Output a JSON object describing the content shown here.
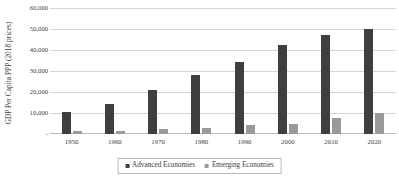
{
  "chart_data": {
    "type": "bar",
    "title": "",
    "subtitle": "",
    "xlabel": "",
    "ylabel": "GDP Per Capita PPP (2018 prices)",
    "categories": [
      "1950",
      "1960",
      "1970",
      "1980",
      "1990",
      "2000",
      "2010",
      "2020"
    ],
    "series": [
      {
        "name": "Advanced Economies",
        "color": "#3f3f3f",
        "values": [
          10400,
          14300,
          21000,
          28000,
          34500,
          42500,
          47000,
          50200
        ]
      },
      {
        "name": "Emerging  Economies",
        "color": "#9a9a9a",
        "values": [
          1200,
          1500,
          2200,
          3000,
          4200,
          4800,
          7800,
          10200
        ]
      }
    ],
    "ylim": [
      0,
      60000
    ],
    "ytick_values": [
      0,
      10000,
      20000,
      30000,
      40000,
      50000,
      60000
    ],
    "ytick_labels": [
      "-",
      "10,000",
      "20,000",
      "30,000",
      "40,000",
      "50,000",
      "60,000"
    ],
    "grid": true,
    "grid_axis": "y",
    "legend_position": "bottom-center",
    "legend_border": true,
    "background": "#ffffff",
    "gridline_color": "#d6d6d6",
    "text_color": "#404040"
  }
}
